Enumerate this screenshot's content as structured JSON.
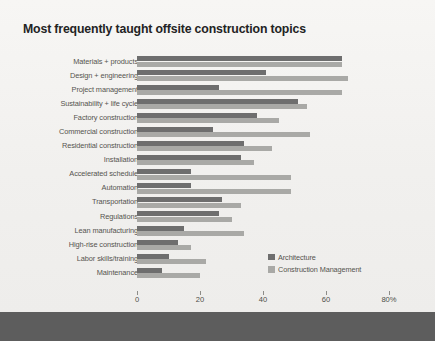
{
  "chart_data": {
    "type": "bar",
    "orientation": "horizontal",
    "title": "Most frequently taught offsite construction topics",
    "xlabel": "",
    "ylabel": "",
    "xlim": [
      0,
      80
    ],
    "xticks": [
      0,
      20,
      40,
      60,
      80
    ],
    "xtick_labels": [
      "0",
      "20",
      "40",
      "60",
      "80%"
    ],
    "grid": false,
    "legend_position": "inside-bottom-right",
    "categories": [
      "Materials + products",
      "Design + engineering",
      "Project management",
      "Sustainability + life cycle",
      "Factory construction",
      "Commercial construction",
      "Residential construction",
      "Installation",
      "Accelerated schedule",
      "Automation",
      "Transportation",
      "Regulations",
      "Lean manufacturing",
      "High-rise construction",
      "Labor skills/training",
      "Maintenance"
    ],
    "series": [
      {
        "name": "Architecture",
        "color": "#6e6e6e",
        "values": [
          65,
          41,
          26,
          51,
          38,
          24,
          34,
          33,
          17,
          17,
          27,
          26,
          15,
          13,
          10,
          8
        ]
      },
      {
        "name": "Construction Management",
        "color": "#a9a9a6",
        "values": [
          65,
          67,
          65,
          54,
          45,
          55,
          43,
          37,
          49,
          49,
          33,
          30,
          34,
          17,
          22,
          20
        ]
      }
    ]
  },
  "legend": {
    "items": [
      {
        "label": "Architecture",
        "swatch": "arch"
      },
      {
        "label": "Construction Management",
        "swatch": "cm"
      }
    ]
  }
}
